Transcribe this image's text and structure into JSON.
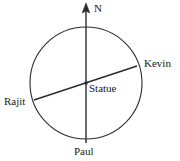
{
  "figure": {
    "type": "compass-circle-diagram",
    "stroke_color": "#2b2b2b",
    "background_color": "#ffffff",
    "circle": {
      "cx": 86,
      "cy": 83,
      "r": 56
    },
    "center_point": {
      "label": "Statue",
      "x": 86,
      "y": 83
    },
    "north_arrow": {
      "label": "N",
      "tip_x": 86,
      "tip_y": 5
    }
  },
  "labels": {
    "north": "N",
    "kevin": "Kevin",
    "statue": "Statue",
    "rajit": "Rajit",
    "paul": "Paul"
  },
  "lines": [
    {
      "name": "north-south-line",
      "from_label": "N",
      "to_label": "Paul",
      "x1": 86,
      "y1": 5,
      "x2": 86,
      "y2": 143
    },
    {
      "name": "kevin-rajit-line",
      "from_label": "Kevin",
      "to_label": "Rajit",
      "x1": 137,
      "y1": 66,
      "x2": 34,
      "y2": 100
    }
  ]
}
